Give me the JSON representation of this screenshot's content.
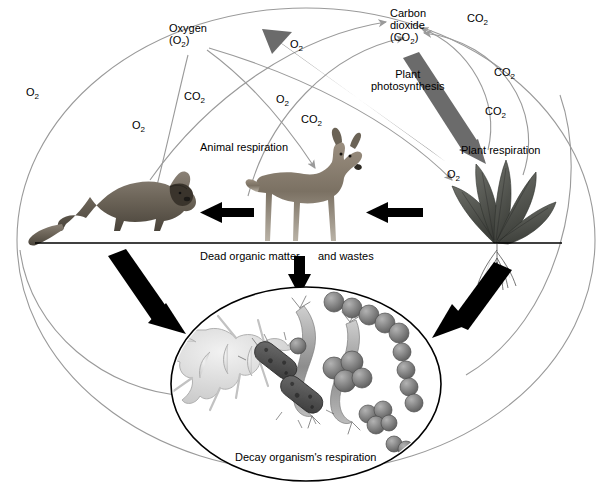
{
  "diagram": {
    "background_color": "#ffffff",
    "line_color": "#9a9a9a",
    "thick_arrow_color": "#6b6b6b",
    "black_arrow_color": "#000000",
    "text_color": "#000000"
  },
  "pools": {
    "oxygen": {
      "line1": "Oxygen",
      "line2": "(O",
      "sub2": "2",
      "line2_end": ")"
    },
    "carbon_dioxide": {
      "line1": "Carbon",
      "line2": "dioxide",
      "line3": "(CO",
      "sub3": "2",
      "line3_end": ")"
    }
  },
  "processes": {
    "animal_respiration": "Animal respiration",
    "plant_photosynthesis_l1": "Plant",
    "plant_photosynthesis_l2": "photosynthesis",
    "plant_respiration": "Plant respiration",
    "decay_respiration": "Decay organism's respiration",
    "dead_organic_matter": "Dead organic matter",
    "and_wastes": "and wastes"
  },
  "gas_labels": [
    {
      "id": "o2-left-outer",
      "text": "O",
      "sub": "2",
      "x": 26,
      "y": 86
    },
    {
      "id": "o2-to-cougar",
      "text": "O",
      "sub": "2",
      "x": 132,
      "y": 119
    },
    {
      "id": "co2-left-mid",
      "text": "CO",
      "sub": "2",
      "x": 184,
      "y": 90
    },
    {
      "id": "co2-from-cougar",
      "text": "CO",
      "sub": "2",
      "x": 301,
      "y": 113
    },
    {
      "id": "o2-top-left",
      "text": "O",
      "sub": "2",
      "x": 290,
      "y": 38
    },
    {
      "id": "o2-mid-right",
      "text": "O",
      "sub": "2",
      "x": 276,
      "y": 93
    },
    {
      "id": "co2-top-right",
      "text": "CO",
      "sub": "2",
      "x": 467,
      "y": 12
    },
    {
      "id": "co2-right-upper",
      "text": "CO",
      "sub": "2",
      "x": 494,
      "y": 66
    },
    {
      "id": "co2-right-lower",
      "text": "CO",
      "sub": "2",
      "x": 485,
      "y": 105
    },
    {
      "id": "o2-to-plant",
      "text": "O",
      "sub": "2",
      "x": 447,
      "y": 168
    }
  ],
  "organisms": {
    "cougar": "cougar",
    "deer": "deer",
    "plant": "leafy-plant",
    "decay_cluster": "decay-organisms"
  },
  "colors": {
    "accent_gray": "#6b6b6b",
    "thin_line": "#9a9a9a",
    "ground_line": "#000000"
  }
}
